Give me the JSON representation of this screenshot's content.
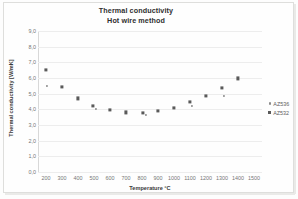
{
  "chart_data": {
    "type": "scatter",
    "title": "Thermal conductivity",
    "subtitle": "Hot wire method",
    "xlabel": "Temperature °C",
    "ylabel": "Thermal conductivity [W/mK]",
    "xlim": [
      150,
      1550
    ],
    "ylim": [
      0,
      9
    ],
    "grid": true,
    "legend_position": "right",
    "xticks": [
      "200",
      "300",
      "400",
      "500",
      "600",
      "700",
      "800",
      "900",
      "1000",
      "1100",
      "1200",
      "1300",
      "1400",
      "1500"
    ],
    "xtick_values": [
      200,
      300,
      400,
      500,
      600,
      700,
      800,
      900,
      1000,
      1100,
      1200,
      1300,
      1400,
      1500
    ],
    "yticks": [
      "0,0",
      "1,0",
      "2,0",
      "3,0",
      "4,0",
      "5,0",
      "6,0",
      "7,0",
      "8,0",
      "9,0"
    ],
    "ytick_values": [
      0,
      1,
      2,
      3,
      4,
      5,
      6,
      7,
      8,
      9
    ],
    "series": [
      {
        "name": "AZ536",
        "marker": "dot",
        "color": "#8b8b8b",
        "points": [
          {
            "x": 205,
            "y": 5.5
          },
          {
            "x": 510,
            "y": 4.05
          },
          {
            "x": 825,
            "y": 3.62
          },
          {
            "x": 1115,
            "y": 4.2
          },
          {
            "x": 1310,
            "y": 4.85
          }
        ]
      },
      {
        "name": "AZ532",
        "marker": "square",
        "color": "#5a5a5a",
        "points": [
          {
            "x": 200,
            "y": 6.5
          },
          {
            "x": 300,
            "y": 5.42
          },
          {
            "x": 400,
            "y": 4.7
          },
          {
            "x": 495,
            "y": 4.22
          },
          {
            "x": 600,
            "y": 3.95
          },
          {
            "x": 700,
            "y": 3.8
          },
          {
            "x": 805,
            "y": 3.78
          },
          {
            "x": 900,
            "y": 3.9
          },
          {
            "x": 1000,
            "y": 4.1
          },
          {
            "x": 1100,
            "y": 4.45
          },
          {
            "x": 1200,
            "y": 4.88
          },
          {
            "x": 1300,
            "y": 5.38
          },
          {
            "x": 1400,
            "y": 5.98
          }
        ]
      }
    ]
  }
}
